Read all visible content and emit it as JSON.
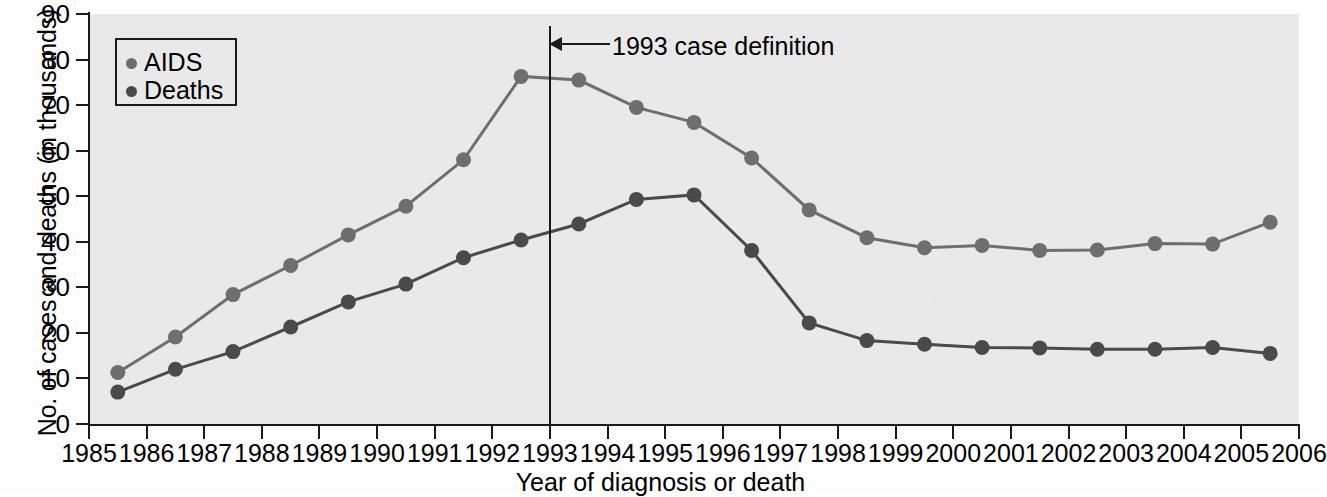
{
  "chart_data": {
    "type": "line",
    "title": "",
    "xlabel": "Year of diagnosis or death",
    "ylabel": "No. of cases and deaths (in thousands)",
    "xlim": [
      1985,
      2006
    ],
    "ylim": [
      0,
      90
    ],
    "ytick_labels": [
      "0",
      "10",
      "20",
      "30",
      "40",
      "50",
      "60",
      "70",
      "80",
      "90"
    ],
    "ytick_values": [
      0,
      10,
      20,
      30,
      40,
      50,
      60,
      70,
      80,
      90
    ],
    "xtick_labels": [
      "1985",
      "1986",
      "1987",
      "1988",
      "1989",
      "1990",
      "1991",
      "1992",
      "1993",
      "1994",
      "1995",
      "1996",
      "1997",
      "1998",
      "1999",
      "2000",
      "2001",
      "2002",
      "2003",
      "2004",
      "2005",
      "2006"
    ],
    "xtick_values": [
      1985,
      1986,
      1987,
      1988,
      1989,
      1990,
      1991,
      1992,
      1993,
      1994,
      1995,
      1996,
      1997,
      1998,
      1999,
      2000,
      2001,
      2002,
      2003,
      2004,
      2005,
      2006
    ],
    "grid": false,
    "legend_position": "top-left",
    "x": [
      1985,
      1986,
      1987,
      1988,
      1989,
      1990,
      1991,
      1992,
      1993,
      1994,
      1995,
      1996,
      1997,
      1998,
      1999,
      2000,
      2001,
      2002,
      2003,
      2004,
      2005
    ],
    "series": [
      {
        "name": "AIDS",
        "color": "#6e6e6e",
        "values": [
          11.3,
          19.1,
          28.4,
          34.8,
          41.5,
          47.8,
          58.0,
          76.3,
          75.5,
          69.5,
          66.2,
          58.4,
          47.0,
          40.9,
          38.7,
          39.2,
          38.1,
          38.2,
          39.6,
          39.5,
          44.3
        ]
      },
      {
        "name": "Deaths",
        "color": "#4a4a4a",
        "values": [
          7.0,
          12.0,
          15.9,
          21.3,
          26.8,
          30.7,
          36.5,
          40.4,
          43.9,
          49.3,
          50.3,
          38.1,
          22.2,
          18.3,
          17.5,
          16.8,
          16.7,
          16.4,
          16.4,
          16.8,
          15.5
        ]
      }
    ],
    "annotations": [
      {
        "label": "1993 case definition",
        "x": 1993,
        "type": "vline-with-arrow"
      }
    ]
  },
  "legend": {
    "items": [
      {
        "label": "AIDS",
        "marker": "circle-marker",
        "color": "#6e6e6e"
      },
      {
        "label": "Deaths",
        "marker": "circle-marker",
        "color": "#4a4a4a"
      }
    ]
  },
  "axis": {
    "y_title": "No. of cases and deaths (in thousands)",
    "x_title": "Year of diagnosis or death"
  },
  "annotation": {
    "text": "1993 case definition"
  },
  "colors": {
    "plot_background": "#e9e9e9",
    "axis": "#1a1a1a",
    "aids_series": "#6e6e6e",
    "deaths_series": "#4a4a4a"
  }
}
